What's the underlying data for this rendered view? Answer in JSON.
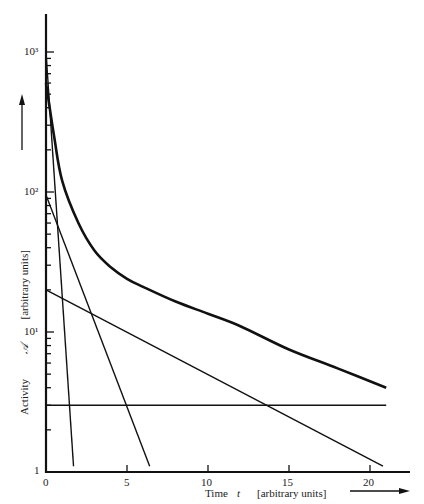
{
  "chart_data": {
    "type": "line",
    "title": "",
    "xlabel": "Time",
    "xlabel_symbol": "t",
    "xlabel_units": "[arbitrary units]",
    "ylabel": "Activity",
    "ylabel_symbol": "A",
    "ylabel_units": "[arbitrary units]",
    "yscale": "log",
    "xlim": [
      0,
      22
    ],
    "ylim": [
      1,
      1500
    ],
    "x_ticks": [
      "0",
      "5",
      "10",
      "15",
      "20"
    ],
    "x_tick_values": [
      0,
      5,
      10,
      15,
      20
    ],
    "y_ticks": [
      "1",
      "10¹",
      "10²",
      "10³"
    ],
    "y_tick_values": [
      1,
      10,
      100,
      1000
    ],
    "grid": false,
    "legend": "none",
    "series": [
      {
        "name": "Total activity (composite decay)",
        "style": "thick",
        "x": [
          0,
          0.5,
          1,
          2,
          3,
          4,
          5,
          6,
          8,
          10,
          12,
          15,
          18,
          21
        ],
        "values": [
          600,
          250,
          120,
          60,
          38,
          29,
          24,
          21,
          16.5,
          13.5,
          11,
          7.5,
          5.5,
          4.0
        ]
      },
      {
        "name": "Component 1 (shortest half-life)",
        "style": "thin",
        "x": [
          0,
          1.7
        ],
        "values": [
          1000,
          1.1
        ]
      },
      {
        "name": "Component 2",
        "style": "thin",
        "x": [
          0,
          6.4
        ],
        "values": [
          95,
          1.1
        ]
      },
      {
        "name": "Component 3",
        "style": "thin",
        "x": [
          0,
          20.8
        ],
        "values": [
          20,
          1.1
        ]
      },
      {
        "name": "Component 4 (long-lived, constant)",
        "style": "thin",
        "x": [
          0,
          21
        ],
        "values": [
          3.0,
          3.0
        ]
      }
    ]
  },
  "labels": {
    "ylabel_word": "Activity",
    "ylabel_symbol": "𝒜",
    "ylabel_units": "[arbitrary units]",
    "xlabel_word": "Time",
    "xlabel_symbol": "t",
    "xlabel_units": "[arbitrary units]",
    "x_ticks": [
      "0",
      "5",
      "10",
      "15",
      "20"
    ],
    "y_ticks": [
      "1",
      "10¹",
      "10²",
      "10³"
    ]
  }
}
